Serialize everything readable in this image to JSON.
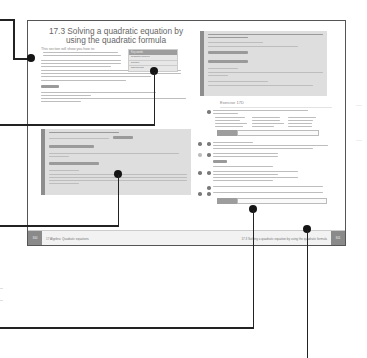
{
  "book": {
    "left_page": {
      "title": "17.3 Solving a quadratic equation by using the quadratic formula",
      "intro_heading": "This section will show you how to:",
      "keywords_box": {
        "heading": "Key words",
        "items": [
          "quadratic formula",
          "solution",
          "discriminant"
        ]
      },
      "page_number": "300",
      "footer": "17 Algebra: Quadratic equations"
    },
    "right_page": {
      "exercise_title": "Exercise 17D",
      "page_number": "301",
      "footer": "17.3 Solving a quadratic equation by using the quadratic formula"
    }
  },
  "colors": {
    "frame": "#555555",
    "callout_line": "#222222",
    "example_bg": "#dedede",
    "example_bar": "#8d8d8d"
  }
}
